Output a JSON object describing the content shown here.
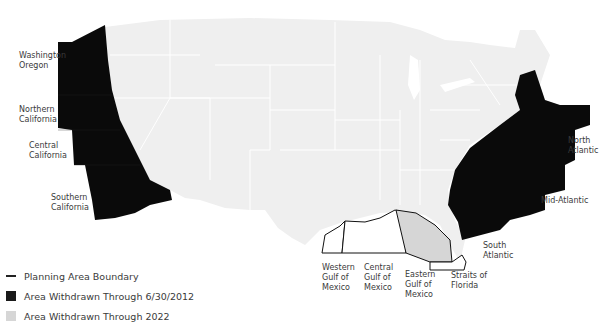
{
  "map": {
    "type": "choropleth",
    "subject": "Offshore planning areas withdrawn",
    "colors": {
      "land": "#efefef",
      "state_border": "#ffffff",
      "withdrawn_2012": "#0a0a0a",
      "withdrawn_2022": "#d6d6d6",
      "boundary": "#222222",
      "water": "#ffffff"
    },
    "regions": {
      "withdrawn_2012": [
        "Washington Oregon",
        "Northern California",
        "Central California",
        "Southern California",
        "North Atlantic",
        "Mid-Atlantic",
        "South Atlantic"
      ],
      "withdrawn_2022": [
        "Eastern Gulf of Mexico"
      ],
      "boundary_only": [
        "Western Gulf of Mexico",
        "Central Gulf of Mexico",
        "Straits of Florida"
      ]
    }
  },
  "labels": {
    "wa_or": "Washington\nOregon",
    "n_cal": "Northern\nCalifornia",
    "c_cal": "Central\nCalifornia",
    "s_cal": "Southern\nCalifornia",
    "n_atl": "North\nAtlantic",
    "mid_atl": "Mid-Atlantic",
    "s_atl": "South\nAtlantic",
    "w_gulf": "Western\nGulf of\nMexico",
    "c_gulf": "Central\nGulf of\nMexico",
    "e_gulf": "Eastern\nGulf of\nMexico",
    "straits": "Straits of\nFlorida"
  },
  "legend": {
    "items": [
      {
        "label": "Planning Area Boundary",
        "kind": "line",
        "color": "#222222"
      },
      {
        "label": "Area Withdrawn Through 6/30/2012",
        "kind": "swatch",
        "color": "#1a1a1a"
      },
      {
        "label": "Area Withdrawn Through 2022",
        "kind": "swatch",
        "color": "#d6d6d6"
      }
    ]
  }
}
